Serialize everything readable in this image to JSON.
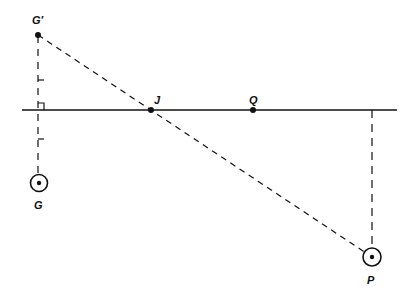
{
  "diagram": {
    "type": "geometry-reflection",
    "line": {
      "y": 110,
      "x1": 22,
      "x2": 397
    },
    "points": {
      "G_prime": {
        "label": "G′",
        "x": 38,
        "y": 35
      },
      "J": {
        "label": "J",
        "x": 151,
        "y": 110
      },
      "Q": {
        "label": "Q",
        "x": 253,
        "y": 110
      },
      "G": {
        "label": "G",
        "x": 39,
        "y": 183
      },
      "P": {
        "label": "P",
        "x": 372,
        "y": 257
      }
    },
    "colors": {
      "ink": "#111111",
      "background": "#ffffff"
    }
  }
}
